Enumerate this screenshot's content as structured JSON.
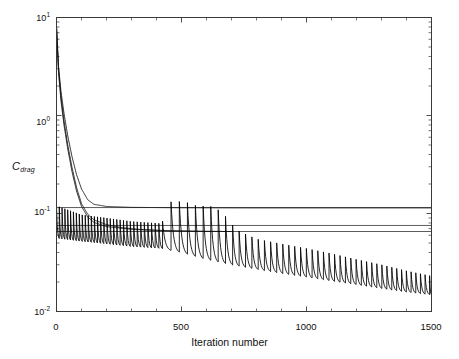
{
  "chart_data": {
    "type": "line",
    "title": "",
    "xlabel": "Iteration number",
    "ylabel_main": "C",
    "ylabel_sub": "drag",
    "xlim": [
      0,
      1500
    ],
    "ylim": [
      0.01,
      10
    ],
    "yscale": "log",
    "xscale": "linear",
    "grid": false,
    "legend": "none",
    "xticks": [
      0,
      500,
      1000,
      1500
    ],
    "xticklabels": [
      "0",
      "500",
      "1000",
      "1500"
    ],
    "yticks": [
      10,
      1,
      0.1,
      0.01
    ],
    "yticklabels_mantissa": [
      "10",
      "10",
      "10",
      "10"
    ],
    "yticklabels_exponent": [
      "1",
      "0",
      "-1",
      "-2"
    ],
    "frame": true,
    "minor_ticks": true,
    "series": [
      {
        "name": "reference-line-upper",
        "kind": "horizontal-line",
        "value": 0.115,
        "x_from": 0,
        "x_to": 1500
      },
      {
        "name": "reference-line-middle",
        "kind": "horizontal-line",
        "value": 0.0755,
        "x_from": 0,
        "x_to": 1500
      },
      {
        "name": "reference-line-lower",
        "kind": "horizontal-line",
        "value": 0.0655,
        "x_from": 0,
        "x_to": 1500
      },
      {
        "name": "smooth-decay-a",
        "kind": "smooth-curve",
        "x": [
          0,
          8,
          18,
          30,
          45,
          62,
          80,
          100,
          125,
          150,
          200,
          300,
          500,
          800,
          1100,
          1500
        ],
        "y": [
          8.0,
          3.2,
          1.75,
          1.05,
          0.62,
          0.38,
          0.25,
          0.178,
          0.138,
          0.124,
          0.118,
          0.1155,
          0.1145,
          0.114,
          0.114,
          0.114
        ]
      },
      {
        "name": "smooth-decay-b",
        "kind": "smooth-curve",
        "x": [
          0,
          8,
          18,
          30,
          45,
          62,
          80,
          100,
          125,
          150,
          200,
          260,
          330,
          400,
          470,
          540,
          600,
          660,
          700
        ],
        "y": [
          8.0,
          3.0,
          1.55,
          0.88,
          0.5,
          0.295,
          0.185,
          0.126,
          0.098,
          0.086,
          0.077,
          0.0718,
          0.0688,
          0.0672,
          0.0663,
          0.0658,
          0.0656,
          0.0655,
          0.0655
        ]
      },
      {
        "name": "smooth-decay-c",
        "kind": "smooth-curve",
        "x": [
          0,
          8,
          18,
          30,
          45,
          62,
          80,
          100,
          125,
          150,
          200,
          300,
          450,
          600,
          700
        ],
        "y": [
          8.0,
          2.75,
          1.4,
          0.8,
          0.455,
          0.268,
          0.17,
          0.118,
          0.092,
          0.081,
          0.0735,
          0.069,
          0.0668,
          0.0658,
          0.0655
        ]
      },
      {
        "name": "optimization-convergence-sawtooth",
        "kind": "sawtooth-decay",
        "description": "Repeated design cycles: each cycle spikes upward then decays; peak and trough envelopes fall from ~0.12/0.055 near x=0 to ~0.022/0.014 at x=1500",
        "peak_envelope": {
          "x": [
            0,
            100,
            200,
            300,
            420,
            460,
            520,
            560,
            620,
            660,
            720,
            800,
            900,
            1000,
            1100,
            1200,
            1300,
            1400,
            1500
          ],
          "y": [
            0.12,
            0.097,
            0.09,
            0.083,
            0.079,
            0.135,
            0.13,
            0.12,
            0.118,
            0.105,
            0.068,
            0.055,
            0.049,
            0.044,
            0.039,
            0.034,
            0.03,
            0.026,
            0.023
          ]
        },
        "trough_envelope": {
          "x": [
            0,
            100,
            200,
            300,
            420,
            500,
            600,
            700,
            800,
            900,
            1000,
            1100,
            1200,
            1300,
            1400,
            1500
          ],
          "y": [
            0.056,
            0.052,
            0.049,
            0.046,
            0.044,
            0.04,
            0.034,
            0.03,
            0.027,
            0.0245,
            0.0225,
            0.0205,
            0.0188,
            0.0172,
            0.0158,
            0.0148
          ]
        },
        "cycle_count_approx": 62,
        "final_value": 0.015
      }
    ]
  },
  "axes": {
    "x_axis_label": "Iteration number",
    "y_axis_label": "C",
    "y_axis_label_subscript": "drag"
  },
  "colors": {
    "curve": "#000000",
    "reference_line": "#4a4a4a",
    "axis": "#3a3a3a",
    "background": "#ffffff"
  }
}
